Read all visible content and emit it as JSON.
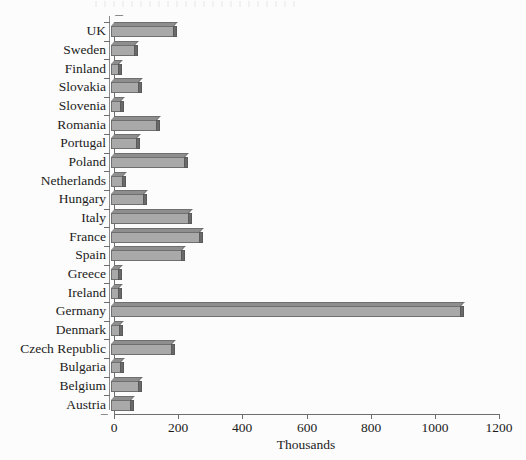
{
  "chart_data": {
    "type": "bar",
    "orientation": "horizontal",
    "title": "",
    "xlabel": "Thousands",
    "ylabel": "",
    "xlim": [
      0,
      1200
    ],
    "xticks": [
      0,
      200,
      400,
      600,
      800,
      1000,
      1200
    ],
    "xtick_labels": [
      "0",
      "200",
      "400",
      "600",
      "800",
      "1000",
      "1200"
    ],
    "grid": false,
    "legend": false,
    "categories": [
      "UK",
      "Sweden",
      "Finland",
      "Slovakia",
      "Slovenia",
      "Romania",
      "Portugal",
      "Poland",
      "Netherlands",
      "Hungary",
      "Italy",
      "France",
      "Spain",
      "Greece",
      "Ireland",
      "Germany",
      "Denmark",
      "Czech Republic",
      "Bulgaria",
      "Belgium",
      "Austria"
    ],
    "values": [
      197,
      75,
      25,
      88,
      31,
      144,
      81,
      231,
      38,
      103,
      244,
      278,
      222,
      25,
      25,
      1091,
      28,
      191,
      31,
      88,
      63
    ],
    "series": [
      {
        "name": "",
        "values": [
          197,
          75,
          25,
          88,
          31,
          144,
          81,
          231,
          38,
          103,
          244,
          278,
          222,
          25,
          25,
          1091,
          28,
          191,
          31,
          88,
          63
        ]
      }
    ],
    "colors": {
      "bar_face": "#a9a9a9",
      "bar_top": "#8e8e8e",
      "bar_cap": "#6a6a6a",
      "bar_outline": "#6f6f6f",
      "axis": "#6d6d6d",
      "text": "#1b1b1b",
      "background": "#fcfcfc"
    }
  }
}
